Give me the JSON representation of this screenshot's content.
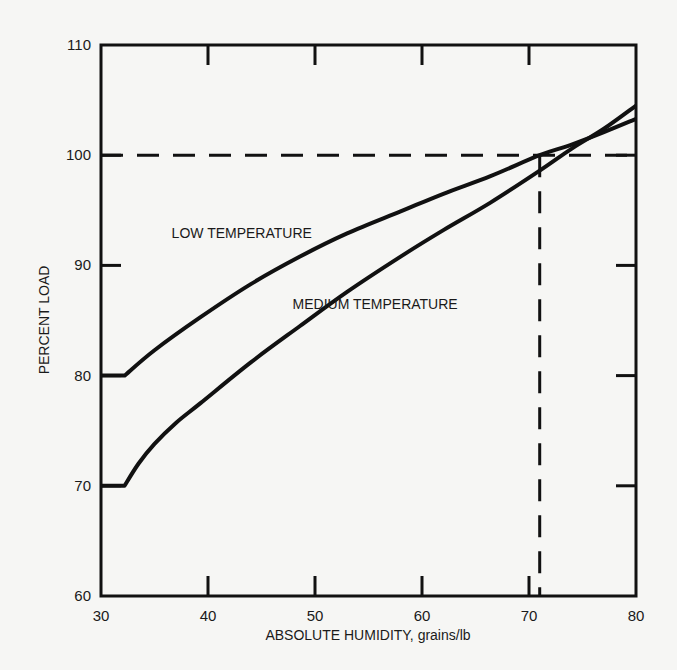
{
  "chart_data": {
    "type": "line",
    "title": "",
    "xlabel": "ABSOLUTE HUMIDITY, grains/lb",
    "ylabel": "PERCENT LOAD",
    "xlim": [
      30,
      80
    ],
    "ylim": [
      60,
      110
    ],
    "xticks": [
      30,
      40,
      50,
      60,
      70,
      80
    ],
    "yticks": [
      60,
      70,
      80,
      90,
      100,
      110
    ],
    "xtick_labels": [
      "30",
      "40",
      "50",
      "60",
      "70",
      "80"
    ],
    "ytick_labels": [
      "60",
      "70",
      "80",
      "90",
      "100",
      "110"
    ],
    "grid": false,
    "legend": "none",
    "series": [
      {
        "name": "LOW TEMPERATURE",
        "x": [
          30,
          32.2,
          35,
          39.3,
          44,
          48.6,
          53,
          58,
          62,
          66.4,
          71,
          73.8,
          77,
          80
        ],
        "y": [
          80,
          80,
          82.3,
          85.3,
          88.3,
          90.8,
          92.9,
          94.9,
          96.5,
          98.1,
          100,
          100.9,
          102.1,
          103.3
        ]
      },
      {
        "name": "MEDIUM TEMPERATURE",
        "x": [
          30,
          32.2,
          33.5,
          35,
          37,
          39.3,
          44,
          48.6,
          53,
          58,
          62,
          66.4,
          71,
          74,
          77,
          80
        ],
        "y": [
          70,
          70,
          72,
          73.8,
          75.7,
          77.5,
          81.2,
          84.5,
          87.6,
          90.8,
          93.2,
          95.7,
          98.6,
          100.6,
          102.4,
          104.5
        ]
      }
    ],
    "reference_lines": [
      {
        "name": "100-percent-load",
        "orientation": "horizontal",
        "value": 100,
        "style": "dashed",
        "x_range": [
          30,
          80
        ]
      },
      {
        "name": "design-humidity",
        "orientation": "vertical",
        "value": 71,
        "style": "dashed",
        "y_range": [
          60,
          100
        ]
      }
    ],
    "annotations": [
      {
        "text": "LOW TEMPERATURE",
        "x": 36.6,
        "y": 92.5
      },
      {
        "text": "MEDIUM TEMPERATURE",
        "x": 47.9,
        "y": 86
      }
    ]
  }
}
